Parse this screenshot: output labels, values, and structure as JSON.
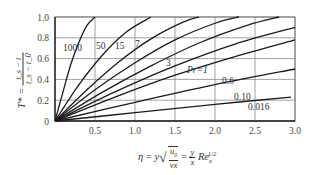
{
  "chart_data": {
    "type": "line",
    "title": "",
    "xlabel": "η = y√(u0/(νx)) = (y/x) Re_x^(1/2)",
    "ylabel": "T* = (t_s − t)/(t_s − t_0)",
    "xlim": [
      0,
      3.0
    ],
    "ylim": [
      0,
      1.0
    ],
    "grid": true,
    "legend": "inline curve labels",
    "x_ticks": [
      "0.5",
      "1.0",
      "1.5",
      "2.0",
      "2.5",
      "3.0"
    ],
    "y_ticks": [
      "0",
      "0.2",
      "0.4",
      "0.6",
      "0.8",
      "1.0"
    ],
    "origin_label": "0",
    "series": [
      {
        "name": "1000",
        "label": "1000",
        "x": [
          0,
          0.1,
          0.2,
          0.3,
          0.4,
          0.5
        ],
        "values": [
          0,
          0.28,
          0.55,
          0.76,
          0.92,
          1.0
        ]
      },
      {
        "name": "50",
        "label": "50",
        "x": [
          0,
          0.3,
          0.6,
          0.9,
          1.2
        ],
        "values": [
          0,
          0.35,
          0.64,
          0.86,
          1.0
        ]
      },
      {
        "name": "15",
        "label": "15",
        "x": [
          0,
          0.4,
          0.8,
          1.2,
          1.6,
          1.8
        ],
        "values": [
          0,
          0.3,
          0.57,
          0.79,
          0.95,
          1.0
        ]
      },
      {
        "name": "7",
        "label": "7",
        "x": [
          0,
          0.5,
          1.0,
          1.5,
          2.0,
          2.3
        ],
        "values": [
          0,
          0.3,
          0.56,
          0.78,
          0.94,
          1.0
        ]
      },
      {
        "name": "3",
        "label": "3",
        "x": [
          0,
          0.6,
          1.2,
          1.8,
          2.4,
          2.8
        ],
        "values": [
          0,
          0.28,
          0.53,
          0.75,
          0.92,
          1.0
        ]
      },
      {
        "name": "Pr=1",
        "label": "Pr=1",
        "x": [
          0,
          0.75,
          1.5,
          2.25,
          3.0
        ],
        "values": [
          0,
          0.28,
          0.53,
          0.74,
          0.9
        ]
      },
      {
        "name": "0.6",
        "label": "0.6",
        "x": [
          0,
          0.75,
          1.5,
          2.25,
          3.0
        ],
        "values": [
          0,
          0.23,
          0.44,
          0.62,
          0.78
        ]
      },
      {
        "name": "0.10",
        "label": "0.10",
        "x": [
          0,
          1.0,
          2.0,
          3.0
        ],
        "values": [
          0,
          0.18,
          0.35,
          0.5
        ]
      },
      {
        "name": "0.016",
        "label": "0.016",
        "x": [
          0,
          1.0,
          2.0,
          2.95
        ],
        "values": [
          0,
          0.08,
          0.16,
          0.23
        ]
      }
    ]
  },
  "labels": {
    "x_eta": "η",
    "x_eq1": "=",
    "x_y": "y",
    "x_u0": "u",
    "x_u0_sub": "0",
    "x_nux": "νx",
    "x_eq2": "=",
    "x_fy": "y",
    "x_fx": "x",
    "x_re": "Re",
    "x_re_sub": "x",
    "x_re_sup": "1/2",
    "y_T": "T*",
    "y_eq": "=",
    "y_num": "t_s − t",
    "y_den": "t_s − t_0"
  }
}
